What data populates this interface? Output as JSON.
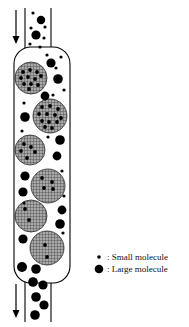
{
  "figure": {
    "type": "size-exclusion-chromatography-column",
    "title": "",
    "background_color": "#ffffff",
    "ink_color": "#000000",
    "bead_fill_color": "#a8a8a8",
    "bead_grid_color": "#3a3a3a",
    "molecule_color": "#000000"
  },
  "column": {
    "name": "chromatography-column",
    "x": 14,
    "y": 47,
    "width": 56,
    "height": 236,
    "corner_radius": 17,
    "stroke_width": 1.1,
    "fill": "#ffffff"
  },
  "inlet": {
    "name": "inlet-tube",
    "left_wall_x": 25,
    "right_wall_x": 51,
    "top_y": 8,
    "bottom_y": 50,
    "label": ""
  },
  "outlet": {
    "name": "outlet-tube",
    "left_wall_x": 25,
    "right_wall_x": 51,
    "top_y": 281,
    "bottom_y": 322,
    "label": ""
  },
  "arrows": [
    {
      "name": "inlet-flow-arrow",
      "direction": "down",
      "x": 16,
      "y_start": 10,
      "y_end": 44,
      "head_width": 7,
      "head_length": 8,
      "label": ""
    },
    {
      "name": "outlet-flow-arrow",
      "direction": "down",
      "x": 16,
      "y_start": 284,
      "y_end": 318,
      "head_width": 7,
      "head_length": 8,
      "label": ""
    }
  ],
  "beads": [
    {
      "id": "bead-1",
      "cx": 31,
      "cy": 78,
      "r": 16,
      "pore_dots": [
        [
          -8,
          -6
        ],
        [
          -1,
          -8
        ],
        [
          6,
          -6
        ],
        [
          -10,
          0
        ],
        [
          -3,
          -1
        ],
        [
          4,
          1
        ],
        [
          10,
          -2
        ],
        [
          -7,
          6
        ],
        [
          0,
          6
        ],
        [
          7,
          7
        ],
        [
          -2,
          11
        ]
      ]
    },
    {
      "id": "bead-2",
      "cx": 50,
      "cy": 116,
      "r": 17,
      "pore_dots": [
        [
          -8,
          -9
        ],
        [
          0,
          -10
        ],
        [
          8,
          -7
        ],
        [
          -11,
          -2
        ],
        [
          -3,
          -2
        ],
        [
          5,
          -1
        ],
        [
          11,
          2
        ],
        [
          -8,
          5
        ],
        [
          -1,
          6
        ],
        [
          7,
          6
        ],
        [
          2,
          12
        ],
        [
          -5,
          11
        ]
      ]
    },
    {
      "id": "bead-3",
      "cx": 30,
      "cy": 150,
      "r": 15,
      "pore_dots": [
        [
          -6,
          -6
        ],
        [
          -9,
          1
        ],
        [
          1,
          -3
        ],
        [
          -3,
          8
        ],
        [
          5,
          2
        ]
      ]
    },
    {
      "id": "bead-4",
      "cx": 48,
      "cy": 186,
      "r": 17,
      "pore_dots": [
        [
          -6,
          -8
        ],
        [
          4,
          -4
        ],
        [
          -4,
          2
        ],
        [
          5,
          3
        ]
      ]
    },
    {
      "id": "bead-5",
      "cx": 31,
      "cy": 216,
      "r": 16,
      "pore_dots": [
        [
          -6,
          -7
        ],
        [
          -2,
          4
        ]
      ]
    },
    {
      "id": "bead-6",
      "cx": 47,
      "cy": 248,
      "r": 17,
      "pore_dots": [
        [
          -2,
          -3
        ],
        [
          0,
          9
        ]
      ]
    }
  ],
  "large_molecules": [
    {
      "id": "lg-inlet-1",
      "cx": 41,
      "cy": 20,
      "r": 4.2
    },
    {
      "id": "lg-inlet-2",
      "cx": 36,
      "cy": 35,
      "r": 4.6
    },
    {
      "id": "lg-col-1",
      "cx": 51,
      "cy": 63,
      "r": 4.6
    },
    {
      "id": "lg-col-2",
      "cx": 58,
      "cy": 79,
      "r": 4.8
    },
    {
      "id": "lg-col-3",
      "cx": 45,
      "cy": 96,
      "r": 4.4
    },
    {
      "id": "lg-col-4",
      "cx": 25,
      "cy": 117,
      "r": 4.8
    },
    {
      "id": "lg-col-5",
      "cx": 60,
      "cy": 140,
      "r": 4.8
    },
    {
      "id": "lg-col-6",
      "cx": 57,
      "cy": 156,
      "r": 4.4
    },
    {
      "id": "lg-col-7",
      "cx": 25,
      "cy": 176,
      "r": 4.6
    },
    {
      "id": "lg-col-8",
      "cx": 23,
      "cy": 192,
      "r": 4.6
    },
    {
      "id": "lg-col-9",
      "cx": 62,
      "cy": 210,
      "r": 4.4
    },
    {
      "id": "lg-col-10",
      "cx": 60,
      "cy": 224,
      "r": 4.8
    },
    {
      "id": "lg-col-11",
      "cx": 23,
      "cy": 239,
      "r": 4.6
    },
    {
      "id": "lg-col-12",
      "cx": 22,
      "cy": 267,
      "r": 5.0
    },
    {
      "id": "lg-col-13",
      "cx": 36,
      "cy": 269,
      "r": 4.8
    },
    {
      "id": "lg-out-1",
      "cx": 33,
      "cy": 282,
      "r": 4.8
    },
    {
      "id": "lg-out-2",
      "cx": 43,
      "cy": 285,
      "r": 4.6
    },
    {
      "id": "lg-out-3",
      "cx": 36,
      "cy": 297,
      "r": 4.8
    },
    {
      "id": "lg-out-4",
      "cx": 44,
      "cy": 305,
      "r": 4.6
    },
    {
      "id": "lg-out-5",
      "cx": 35,
      "cy": 315,
      "r": 4.8
    }
  ],
  "small_molecules": [
    {
      "id": "sm-inlet-1",
      "cx": 33,
      "cy": 13,
      "r": 1.6
    },
    {
      "id": "sm-inlet-2",
      "cx": 45,
      "cy": 27,
      "r": 1.6
    },
    {
      "id": "sm-inlet-3",
      "cx": 31,
      "cy": 28,
      "r": 1.6
    },
    {
      "id": "sm-inlet-4",
      "cx": 44,
      "cy": 38,
      "r": 1.6
    },
    {
      "id": "sm-inlet-5",
      "cx": 30,
      "cy": 44,
      "r": 1.6
    },
    {
      "id": "sm-inlet-6",
      "cx": 40,
      "cy": 47,
      "r": 1.6
    },
    {
      "id": "sm-col-1",
      "cx": 47,
      "cy": 55,
      "r": 1.6
    },
    {
      "id": "sm-col-2",
      "cx": 61,
      "cy": 57,
      "r": 1.6
    },
    {
      "id": "sm-col-3",
      "cx": 56,
      "cy": 68,
      "r": 1.6
    },
    {
      "id": "sm-col-4",
      "cx": 64,
      "cy": 90,
      "r": 1.6
    },
    {
      "id": "sm-col-5",
      "cx": 53,
      "cy": 95,
      "r": 1.6
    },
    {
      "id": "sm-col-6",
      "cx": 24,
      "cy": 103,
      "r": 1.6
    },
    {
      "id": "sm-col-7",
      "cx": 22,
      "cy": 131,
      "r": 1.6
    },
    {
      "id": "sm-col-8",
      "cx": 48,
      "cy": 137,
      "r": 1.6
    },
    {
      "id": "sm-col-9",
      "cx": 62,
      "cy": 171,
      "r": 1.6
    },
    {
      "id": "sm-col-10",
      "cx": 24,
      "cy": 203,
      "r": 1.6
    },
    {
      "id": "sm-col-11",
      "cx": 64,
      "cy": 196,
      "r": 1.6
    },
    {
      "id": "sm-col-12",
      "cx": 63,
      "cy": 233,
      "r": 1.6
    }
  ],
  "legend": {
    "name": "legend",
    "x": 94,
    "y": 252,
    "entries": [
      {
        "marker": "small-molecule-dot",
        "marker_radius": 1.8,
        "marker_cx": 99,
        "marker_cy": 257,
        "separator": ":",
        "label": "Small molecule"
      },
      {
        "marker": "large-molecule-dot",
        "marker_radius": 4.3,
        "marker_cx": 99,
        "marker_cy": 269,
        "separator": ":",
        "label": "Large molecule"
      }
    ]
  }
}
